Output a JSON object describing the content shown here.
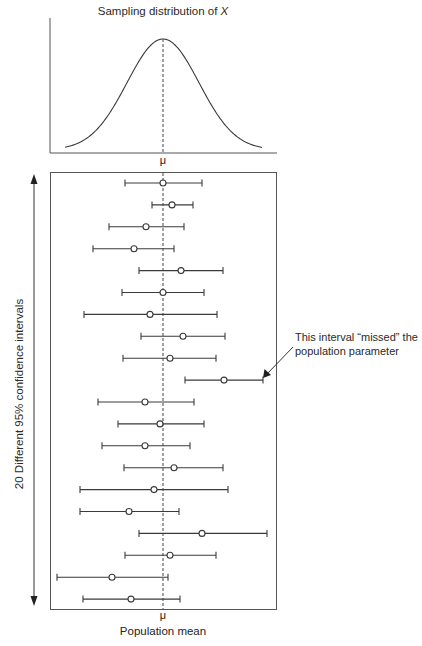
{
  "figure": {
    "top_title_prefix": "Sampling distribution of ",
    "top_title_var": "X",
    "top_x_label": "μ",
    "bottom_x_label_symbol": "μ",
    "bottom_x_label": "Population mean",
    "y_axis_label": "20 Different 95% confidence intervals",
    "annotation_line1": "This interval “missed” the",
    "annotation_line2": "population parameter"
  },
  "colors": {
    "line": "#3a3a3a",
    "frame": "#555555",
    "dashed": "#444444",
    "marker_fill": "#ffffff"
  },
  "chart_data": [
    {
      "type": "line",
      "title": "Sampling distribution of X",
      "xlabel": "μ",
      "ylabel": "",
      "description": "Normal (bell-shaped) density curve centered at the population mean μ, with a dashed vertical line at μ",
      "x_center": "μ",
      "grid": false
    },
    {
      "type": "scatter",
      "title": "",
      "xlabel": "Population mean (μ)",
      "ylabel": "20 Different 95% confidence intervals",
      "description": "20 confidence intervals shown as horizontal error bars with open-circle point estimates; dashed vertical line at μ. Positions in units relative to μ = 0 (pixel-scaled, +/- ~100 span).",
      "mu": 0,
      "intervals": [
        {
          "id": 1,
          "lower": -38,
          "estimate": 0,
          "upper": 39,
          "contains_mu": true
        },
        {
          "id": 2,
          "lower": -11,
          "estimate": 9,
          "upper": 30,
          "contains_mu": true
        },
        {
          "id": 3,
          "lower": -54,
          "estimate": -17,
          "upper": 21,
          "contains_mu": true
        },
        {
          "id": 4,
          "lower": -70,
          "estimate": -29,
          "upper": 11,
          "contains_mu": true
        },
        {
          "id": 5,
          "lower": -24,
          "estimate": 18,
          "upper": 60,
          "contains_mu": true
        },
        {
          "id": 6,
          "lower": -41,
          "estimate": 0,
          "upper": 41,
          "contains_mu": true
        },
        {
          "id": 7,
          "lower": -79,
          "estimate": -13,
          "upper": 54,
          "contains_mu": true
        },
        {
          "id": 8,
          "lower": -22,
          "estimate": 20,
          "upper": 62,
          "contains_mu": true
        },
        {
          "id": 9,
          "lower": -40,
          "estimate": 7,
          "upper": 53,
          "contains_mu": true
        },
        {
          "id": 10,
          "lower": 22,
          "estimate": 61,
          "upper": 100,
          "contains_mu": false
        },
        {
          "id": 11,
          "lower": -65,
          "estimate": -18,
          "upper": 31,
          "contains_mu": true
        },
        {
          "id": 12,
          "lower": -45,
          "estimate": -3,
          "upper": 41,
          "contains_mu": true
        },
        {
          "id": 13,
          "lower": -61,
          "estimate": -18,
          "upper": 27,
          "contains_mu": true
        },
        {
          "id": 14,
          "lower": -39,
          "estimate": 11,
          "upper": 60,
          "contains_mu": true
        },
        {
          "id": 15,
          "lower": -83,
          "estimate": -9,
          "upper": 65,
          "contains_mu": true
        },
        {
          "id": 16,
          "lower": -83,
          "estimate": -34,
          "upper": 16,
          "contains_mu": true
        },
        {
          "id": 17,
          "lower": -24,
          "estimate": 39,
          "upper": 104,
          "contains_mu": true
        },
        {
          "id": 18,
          "lower": -38,
          "estimate": 7,
          "upper": 53,
          "contains_mu": true
        },
        {
          "id": 19,
          "lower": -106,
          "estimate": -51,
          "upper": 5,
          "contains_mu": true
        },
        {
          "id": 20,
          "lower": -80,
          "estimate": -32,
          "upper": 17,
          "contains_mu": true
        }
      ],
      "annotation": {
        "text": "This interval “missed” the population parameter",
        "points_to_interval": 10
      }
    }
  ]
}
